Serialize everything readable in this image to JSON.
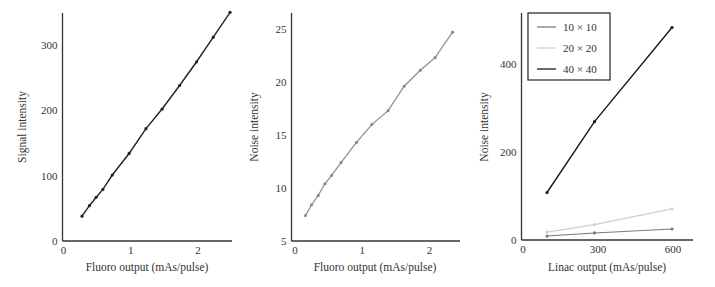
{
  "chart_data": [
    {
      "type": "line",
      "title": "",
      "xlabel": "Fluoro output (mAs/pulse)",
      "ylabel": "Signal intensity",
      "xlim": [
        0,
        2.5
      ],
      "ylim": [
        0,
        350
      ],
      "xticks": [
        0,
        1,
        2
      ],
      "yticks": [
        0,
        100,
        200,
        300
      ],
      "grid": false,
      "legend": null,
      "series": [
        {
          "name": "Signal",
          "color": "#222222",
          "x": [
            0.29,
            0.4,
            0.5,
            0.6,
            0.74,
            0.99,
            1.24,
            1.48,
            1.74,
            1.99,
            2.24,
            2.49
          ],
          "y": [
            38,
            54,
            67,
            79,
            101,
            134,
            172,
            202,
            238,
            274,
            312,
            350
          ]
        }
      ]
    },
    {
      "type": "line",
      "title": "",
      "xlabel": "Fluoro output (mAs/pulse)",
      "ylabel": "Noise intensity",
      "xlim": [
        0,
        2.5
      ],
      "ylim": [
        5,
        26.5
      ],
      "xticks": [
        0,
        1,
        2
      ],
      "yticks": [
        5,
        10,
        15,
        20,
        25
      ],
      "grid": false,
      "legend": null,
      "series": [
        {
          "name": "Noise",
          "color": "#8c8c8c",
          "x": [
            0.17,
            0.26,
            0.36,
            0.46,
            0.56,
            0.7,
            0.93,
            1.16,
            1.4,
            1.64,
            1.88,
            2.1,
            2.36
          ],
          "y": [
            7.4,
            8.4,
            9.3,
            10.4,
            11.2,
            12.4,
            14.3,
            16.0,
            17.3,
            19.6,
            21.1,
            22.3,
            24.7
          ]
        }
      ]
    },
    {
      "type": "line",
      "title": "",
      "xlabel": "Linac output (mAs/pulse)",
      "ylabel": "Noise intensity",
      "xlim": [
        0,
        690
      ],
      "ylim": [
        0,
        520
      ],
      "xticks": [
        0,
        300,
        600
      ],
      "yticks": [
        0,
        200,
        400
      ],
      "grid": false,
      "legend": {
        "position": "upper left",
        "entries": [
          "10 × 10",
          "20 × 20",
          "40 × 40"
        ]
      },
      "series": [
        {
          "name": "10 × 10",
          "color": "#7a7a7a",
          "x": [
            100,
            290,
            600
          ],
          "y": [
            9,
            16,
            25
          ]
        },
        {
          "name": "20 × 20",
          "color": "#cfcfcf",
          "x": [
            100,
            290,
            600
          ],
          "y": [
            18,
            35,
            71
          ]
        },
        {
          "name": "40 × 40",
          "color": "#1a1a1a",
          "x": [
            100,
            290,
            600
          ],
          "y": [
            108,
            269,
            483
          ]
        }
      ]
    }
  ],
  "panels": [
    {
      "xlabel": "Fluoro output (mAs/pulse)",
      "ylabel": "Signal intensity"
    },
    {
      "xlabel": "Fluoro output (mAs/pulse)",
      "ylabel": "Noise intensity"
    },
    {
      "xlabel": "Linac output (mAs/pulse)",
      "ylabel": "Noise intensity"
    }
  ]
}
